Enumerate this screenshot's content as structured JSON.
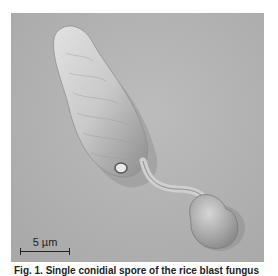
{
  "figure": {
    "scale_bar": {
      "label": "5 µm"
    },
    "caption": "Fig. 1. Single conidial spore of the rice blast fungus"
  }
}
